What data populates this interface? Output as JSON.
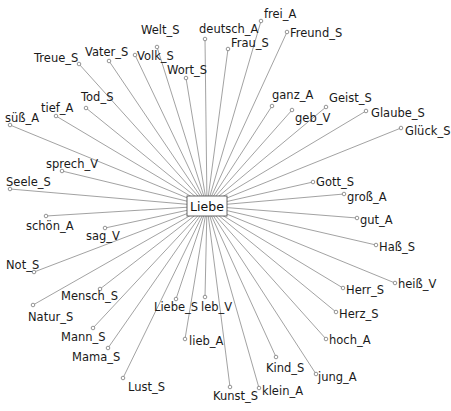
{
  "diagram": {
    "type": "radial-association-graph",
    "center": {
      "label": "Liebe",
      "x": 207,
      "y": 206
    },
    "nodes": [
      {
        "label": "Welt_S",
        "nx": 157,
        "ny": 47,
        "lx": 141,
        "ly": 34
      },
      {
        "label": "deutsch_A",
        "nx": 205,
        "ny": 39,
        "lx": 199,
        "ly": 33
      },
      {
        "label": "frei_A",
        "nx": 261,
        "ny": 21,
        "lx": 264,
        "ly": 18
      },
      {
        "label": "Frau_S",
        "nx": 228,
        "ny": 49,
        "lx": 231,
        "ly": 47
      },
      {
        "label": "Freund_S",
        "nx": 287,
        "ny": 32,
        "lx": 290,
        "ly": 37
      },
      {
        "label": "Treue_S",
        "nx": 79,
        "ny": 64,
        "lx": 34,
        "ly": 62
      },
      {
        "label": "Vater_S",
        "nx": 109,
        "ny": 61,
        "lx": 85,
        "ly": 56
      },
      {
        "label": "Volk_S",
        "nx": 135,
        "ny": 55,
        "lx": 137,
        "ly": 60
      },
      {
        "label": "Wort_S",
        "nx": 186,
        "ny": 78,
        "lx": 167,
        "ly": 74
      },
      {
        "label": "Tod_S",
        "nx": 86,
        "ny": 108,
        "lx": 81,
        "ly": 101
      },
      {
        "label": "tief_A",
        "nx": 56,
        "ny": 116,
        "lx": 41,
        "ly": 112
      },
      {
        "label": "süß_A",
        "nx": 10,
        "ny": 125,
        "lx": 5,
        "ly": 122
      },
      {
        "label": "ganz_A",
        "nx": 272,
        "ny": 106,
        "lx": 272,
        "ly": 99
      },
      {
        "label": "geb_V",
        "nx": 292,
        "ny": 110,
        "lx": 295,
        "ly": 122
      },
      {
        "label": "Geist_S",
        "nx": 326,
        "ny": 107,
        "lx": 329,
        "ly": 102
      },
      {
        "label": "Glaube_S",
        "nx": 366,
        "ny": 111,
        "lx": 371,
        "ly": 117
      },
      {
        "label": "Glück_S",
        "nx": 401,
        "ny": 128,
        "lx": 405,
        "ly": 135
      },
      {
        "label": "sprech_V",
        "nx": 62,
        "ny": 171,
        "lx": 46,
        "ly": 168
      },
      {
        "label": "Seele_S",
        "nx": 10,
        "ny": 189,
        "lx": 6,
        "ly": 186
      },
      {
        "label": "Gott_S",
        "nx": 313,
        "ny": 182,
        "lx": 316,
        "ly": 186
      },
      {
        "label": "groß_A",
        "nx": 344,
        "ny": 194,
        "lx": 347,
        "ly": 201
      },
      {
        "label": "gut_A",
        "nx": 357,
        "ny": 218,
        "lx": 360,
        "ly": 224
      },
      {
        "label": "Haß_S",
        "nx": 376,
        "ny": 245,
        "lx": 379,
        "ly": 251
      },
      {
        "label": "schön_A",
        "nx": 46,
        "ny": 216,
        "lx": 26,
        "ly": 230
      },
      {
        "label": "sag_V",
        "nx": 105,
        "ny": 228,
        "lx": 86,
        "ly": 240
      },
      {
        "label": "Not_S",
        "nx": 34,
        "ny": 272,
        "lx": 6,
        "ly": 269
      },
      {
        "label": "heiß_V",
        "nx": 395,
        "ny": 283,
        "lx": 398,
        "ly": 288
      },
      {
        "label": "Herr_S",
        "nx": 343,
        "ny": 288,
        "lx": 346,
        "ly": 294
      },
      {
        "label": "Herz_S",
        "nx": 336,
        "ny": 312,
        "lx": 339,
        "ly": 318
      },
      {
        "label": "hoch_A",
        "nx": 326,
        "ny": 339,
        "lx": 329,
        "ly": 344
      },
      {
        "label": "Mensch_S",
        "nx": 100,
        "ny": 289,
        "lx": 61,
        "ly": 300
      },
      {
        "label": "Natur_S",
        "nx": 33,
        "ny": 305,
        "lx": 28,
        "ly": 321
      },
      {
        "label": "Mann_S",
        "nx": 93,
        "ny": 328,
        "lx": 61,
        "ly": 341
      },
      {
        "label": "Mama_S",
        "nx": 108,
        "ny": 348,
        "lx": 72,
        "ly": 361
      },
      {
        "label": "Lust_S",
        "nx": 123,
        "ny": 378,
        "lx": 128,
        "ly": 391
      },
      {
        "label": "Liebe_S",
        "nx": 176,
        "ny": 299,
        "lx": 154,
        "ly": 311
      },
      {
        "label": "leb_V",
        "nx": 205,
        "ny": 297,
        "lx": 201,
        "ly": 311
      },
      {
        "label": "lieb_A",
        "nx": 185,
        "ny": 339,
        "lx": 189,
        "ly": 345
      },
      {
        "label": "Kind_S",
        "nx": 276,
        "ny": 357,
        "lx": 266,
        "ly": 372
      },
      {
        "label": "jung_A",
        "nx": 316,
        "ny": 374,
        "lx": 318,
        "ly": 381
      },
      {
        "label": "Kunst_S",
        "nx": 230,
        "ny": 387,
        "lx": 213,
        "ly": 400
      },
      {
        "label": "klein_A",
        "nx": 259,
        "ny": 388,
        "lx": 262,
        "ly": 395
      }
    ]
  }
}
